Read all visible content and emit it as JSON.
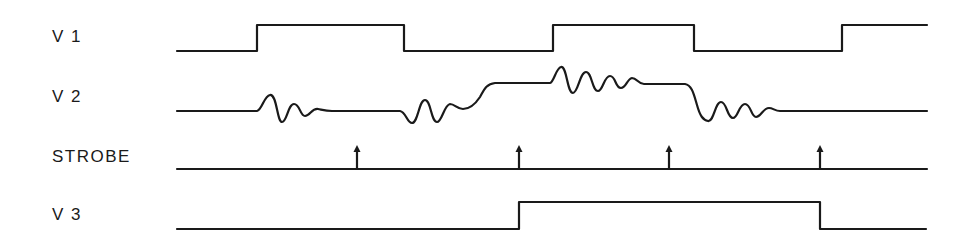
{
  "diagram": {
    "type": "timing-diagram",
    "signals": [
      {
        "name": "V 1",
        "kind": "digital",
        "transitions_x": [
          257,
          404,
          553,
          694,
          842
        ],
        "initial": "low"
      },
      {
        "name": "V 2",
        "kind": "analog-with-ringing"
      },
      {
        "name": "STROBE",
        "kind": "strobe-pulses",
        "arrows_x": [
          357,
          519,
          669,
          820
        ]
      },
      {
        "name": "V 3",
        "kind": "digital",
        "transitions_x": [
          519,
          820
        ],
        "initial": "low"
      }
    ]
  }
}
